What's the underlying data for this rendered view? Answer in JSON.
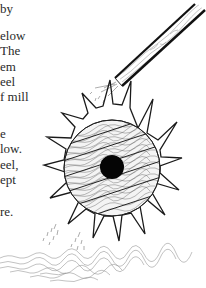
{
  "page": {
    "text_lines": [
      {
        "text": "by",
        "top": 1
      },
      {
        "text": "elow",
        "top": 28
      },
      {
        "text": "The",
        "top": 43
      },
      {
        "text": "em",
        "top": 59
      },
      {
        "text": "eel",
        "top": 74
      },
      {
        "text": "f mill",
        "top": 89
      },
      {
        "text": "e",
        "top": 126
      },
      {
        "text": "low.",
        "top": 141
      },
      {
        "text": "eel,",
        "top": 157
      },
      {
        "text": "ept",
        "top": 172
      },
      {
        "text": "re.",
        "top": 204
      }
    ]
  },
  "illustration": {
    "subject": "water-wheel",
    "elements": [
      "water-chute",
      "paddle-wheel",
      "axle-hole",
      "falling-water",
      "water-ripples"
    ],
    "ink_color": "#1a1a1a",
    "hatch_color": "#555555"
  }
}
